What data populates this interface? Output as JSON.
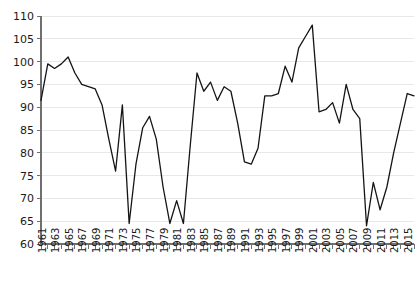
{
  "chart_data": {
    "type": "line",
    "title": "",
    "subtitle": "",
    "xlabel": "",
    "ylabel": "",
    "xlim": [
      1961,
      2016
    ],
    "ylim": [
      60,
      110
    ],
    "y_ticks": [
      60,
      65,
      70,
      75,
      80,
      85,
      90,
      95,
      100,
      105,
      110
    ],
    "y_tick_labels": [
      "60",
      "65",
      "70",
      "75",
      "80",
      "85",
      "90",
      "95",
      "100",
      "105",
      "110"
    ],
    "x_tick_labels": [
      "1961",
      "1963",
      "1965",
      "1967",
      "1969",
      "1971",
      "1973",
      "1975",
      "1977",
      "1979",
      "1981",
      "1983",
      "1985",
      "1987",
      "1989",
      "1991",
      "1993",
      "1995",
      "1997",
      "1999",
      "2001",
      "2003",
      "2005",
      "2007",
      "2009",
      "2011",
      "2013",
      "2015"
    ],
    "x_tick_label_step": 2,
    "x_minor_tick_step": 1,
    "grid": true,
    "grid_axis": "y",
    "legend": false,
    "legend_position": "none",
    "line_color": "#141414",
    "grid_color": "#e8e8e8",
    "axis_color": "#6f6f6f",
    "x": [
      1961,
      1962,
      1963,
      1964,
      1965,
      1966,
      1967,
      1968,
      1969,
      1970,
      1971,
      1972,
      1973,
      1974,
      1975,
      1976,
      1977,
      1978,
      1979,
      1980,
      1981,
      1982,
      1983,
      1984,
      1985,
      1986,
      1987,
      1988,
      1989,
      1990,
      1991,
      1992,
      1993,
      1994,
      1995,
      1996,
      1997,
      1998,
      1999,
      2000,
      2001,
      2002,
      2003,
      2004,
      2005,
      2006,
      2007,
      2008,
      2009,
      2010,
      2011,
      2012,
      2013,
      2014,
      2015,
      2016
    ],
    "values": [
      91.5,
      99.5,
      98.5,
      99.5,
      101.0,
      97.5,
      95.0,
      94.5,
      94.0,
      90.5,
      83.0,
      76.0,
      90.5,
      64.5,
      77.5,
      85.5,
      88.0,
      83.0,
      72.5,
      64.5,
      69.5,
      64.5,
      81.5,
      97.5,
      93.5,
      95.5,
      91.5,
      94.5,
      93.5,
      86.5,
      78.0,
      77.5,
      81.0,
      92.5,
      92.5,
      93.0,
      99.0,
      95.5,
      103.0,
      105.5,
      108.0,
      89.0,
      89.5,
      91.0,
      86.5,
      95.0,
      89.5,
      87.5,
      64.0,
      73.5,
      67.5,
      72.5,
      80.0,
      86.5,
      93.0,
      92.5
    ],
    "series_name": "value"
  }
}
